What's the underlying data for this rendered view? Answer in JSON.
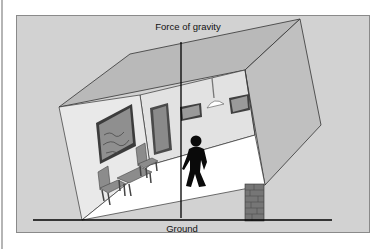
{
  "figure": {
    "top_label": "Force of gravity",
    "bottom_label": "Ground"
  },
  "colors": {
    "panel": "#d2d2d2",
    "panel_border": "#8a8a8a",
    "roof": "#b9b9b9",
    "right_wall": "#bdbdbd",
    "back_wall": "#e4e4e4",
    "left_wall": "#e8e8e8",
    "floor": "#ffffff",
    "brick": "#6f6f6f",
    "figure": "#0a0a0a"
  }
}
